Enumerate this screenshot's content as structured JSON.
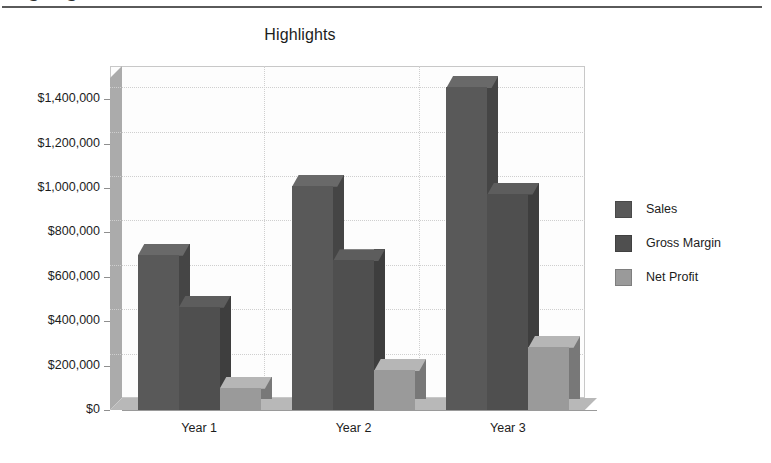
{
  "document": {
    "clipped_heading": "Highlights",
    "rule_color": "#5a5a5a"
  },
  "chart_data": {
    "type": "bar",
    "subtype": "3d-clustered-column",
    "title": "Highlights",
    "xlabel": "",
    "ylabel": "",
    "categories": [
      "Year 1",
      "Year 2",
      "Year 3"
    ],
    "series": [
      {
        "name": "Sales",
        "color": "#595959",
        "values": [
          700000,
          1010000,
          1455000
        ]
      },
      {
        "name": "Gross Margin",
        "color": "#4f4f4f",
        "values": [
          465000,
          675000,
          975000
        ]
      },
      {
        "name": "Net Profit",
        "color": "#9a9a9a",
        "values": [
          100000,
          180000,
          285000
        ]
      }
    ],
    "ylim": [
      0,
      1550000
    ],
    "ytick_values": [
      0,
      200000,
      400000,
      600000,
      800000,
      1000000,
      1200000,
      1400000
    ],
    "ytick_labels": [
      "$0",
      "$200,000",
      "$400,000",
      "$600,000",
      "$800,000",
      "$1,000,000",
      "$1,200,000",
      "$1,400,000"
    ],
    "grid": true,
    "legend_position": "right",
    "plot_background": "#fdfdfd",
    "wall_color": "#ababab",
    "floor_color": "#b8b8b8",
    "gridline_color": "#cfcfcf"
  }
}
